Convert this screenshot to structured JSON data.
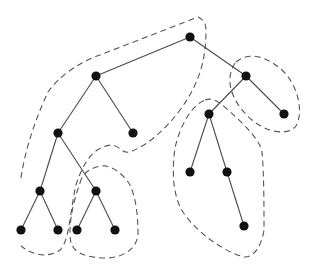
{
  "diagram": {
    "type": "tree-partition",
    "colors": {
      "node": "#111111",
      "edge": "#4a4a4a",
      "group_outline": "#555555",
      "background": "#ffffff"
    },
    "nodes": [
      {
        "id": "A",
        "x": 190,
        "y": 37
      },
      {
        "id": "B",
        "x": 96,
        "y": 76
      },
      {
        "id": "C",
        "x": 246,
        "y": 76
      },
      {
        "id": "D",
        "x": 58,
        "y": 133
      },
      {
        "id": "E",
        "x": 133,
        "y": 133
      },
      {
        "id": "F",
        "x": 209,
        "y": 114
      },
      {
        "id": "G",
        "x": 284,
        "y": 114
      },
      {
        "id": "H",
        "x": 40,
        "y": 191
      },
      {
        "id": "I",
        "x": 96,
        "y": 191
      },
      {
        "id": "J",
        "x": 190,
        "y": 172
      },
      {
        "id": "K",
        "x": 227,
        "y": 172
      },
      {
        "id": "L",
        "x": 21,
        "y": 230
      },
      {
        "id": "M",
        "x": 58,
        "y": 230
      },
      {
        "id": "N",
        "x": 77,
        "y": 230
      },
      {
        "id": "O",
        "x": 115,
        "y": 230
      },
      {
        "id": "P",
        "x": 244,
        "y": 226
      }
    ],
    "edges": [
      [
        "A",
        "B"
      ],
      [
        "A",
        "C"
      ],
      [
        "B",
        "D"
      ],
      [
        "B",
        "E"
      ],
      [
        "C",
        "F"
      ],
      [
        "C",
        "G"
      ],
      [
        "D",
        "H"
      ],
      [
        "D",
        "I"
      ],
      [
        "F",
        "J"
      ],
      [
        "F",
        "K"
      ],
      [
        "H",
        "L"
      ],
      [
        "H",
        "M"
      ],
      [
        "I",
        "N"
      ],
      [
        "I",
        "O"
      ],
      [
        "K",
        "P"
      ]
    ],
    "groups": [
      {
        "name": "group-root-left-spine",
        "members": [
          "A",
          "B",
          "D",
          "E",
          "H",
          "L",
          "M"
        ],
        "path": "M 21 178 C 25 150, 35 120, 48 92 C 60 75, 80 62, 100 55 L 198 17 C 204 20, 206 24, 206 30 C 206 55, 202 80, 180 110 C 165 130, 148 145, 130 152 C 122 154, 120 146, 112 145 C 95 146, 84 160, 76 185 C 70 210, 70 240, 60 250 C 50 257, 35 257, 21 246"
      },
      {
        "name": "group-C-G",
        "members": [
          "C",
          "G"
        ],
        "path": "M 236 62 C 248 52, 265 55, 282 70 C 298 85, 304 112, 296 126 C 288 136, 268 133, 252 120 C 234 105, 222 80, 236 62 Z"
      },
      {
        "name": "group-F-J-K-P",
        "members": [
          "F",
          "J",
          "K",
          "P"
        ],
        "path": "M 205 100 C 212 97, 220 102, 228 110 C 245 125, 260 140, 262 152 C 264 175, 264 205, 264 230 C 262 245, 254 258, 244 257 C 225 252, 200 235, 185 215 C 172 198, 172 170, 175 148 C 180 125, 192 105, 205 100 Z"
      },
      {
        "name": "group-I-N-O",
        "members": [
          "I",
          "N",
          "O"
        ],
        "path": "M 80 183 C 82 172, 95 165, 106 166 C 115 168, 124 175, 130 185 C 136 198, 138 215, 138 235 C 136 250, 122 258, 105 258 C 90 258, 74 254, 71 243 C 68 228, 72 205, 80 183 Z"
      }
    ]
  }
}
